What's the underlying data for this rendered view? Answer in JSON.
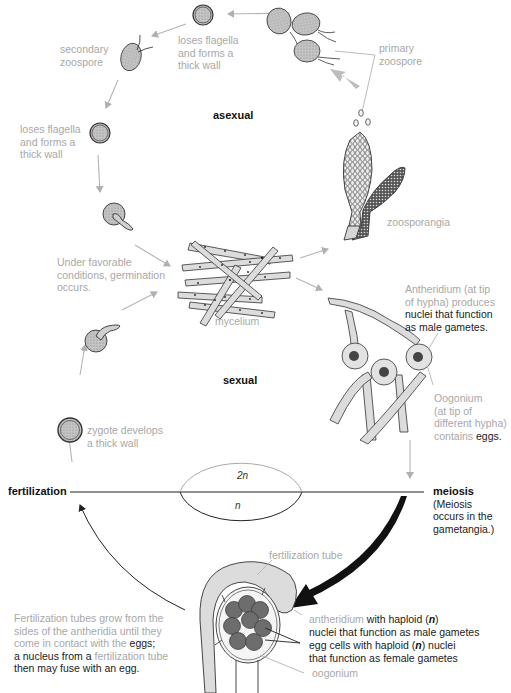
{
  "diagram": {
    "phases": {
      "asexual": "asexual",
      "sexual": "sexual"
    },
    "ploidy": {
      "diploid": "2n",
      "haploid": "n"
    },
    "events": {
      "fertilization": "fertilization",
      "meiosis": "meiosis",
      "meiosis_note": [
        "(Meiosis",
        "occurs in the",
        "gametangia.)"
      ]
    },
    "labels": {
      "loses_flagella_top": [
        "loses flagella",
        "and forms a",
        "thick wall"
      ],
      "secondary_zoospore": [
        "secondary",
        "zoospore"
      ],
      "loses_flagella_left": [
        "loses flagella",
        "and forms a",
        "thick wall"
      ],
      "primary_zoospore": [
        "primary",
        "zoospore"
      ],
      "zoosporangia": "zoosporangia",
      "germination": [
        "Under favorable",
        "conditions, germination",
        "occurs."
      ],
      "mycelium": "mycelium",
      "antheridium_top": {
        "gray": [
          "Antheridium (at tip",
          "of hypha) produces"
        ],
        "dark": [
          "nuclei that function",
          "as male gametes."
        ]
      },
      "oogonium_top": {
        "gray": [
          "Oogonium",
          "(at tip of",
          "different hypha)",
          "contains "
        ],
        "dark": "eggs."
      },
      "zygote": [
        "zygote develops",
        "a thick wall"
      ],
      "fertilization_tubes": {
        "line1": "Fertilization tubes grow from the",
        "line2": "sides of the antheridia until they",
        "line3_gray": "come in contact with the ",
        "line3_dark": "eggs;",
        "line4_dark": "a nucleus from a ",
        "line4_gray": "fertilization tube",
        "line5_dark": "then may fuse with an egg."
      },
      "fertilization_tube": "fertilization tube",
      "antheridium_bottom": {
        "gray": "antheridium",
        "dark1": " with haploid (",
        "n": "n",
        "dark2": ")",
        "line2": "nuclei that function as male gametes"
      },
      "egg_cells": {
        "line1a": "egg cells with haploid (",
        "n": "n",
        "line1b": ") nuclei",
        "line2": "that function as female gametes"
      },
      "oogonium_bottom": "oogonium"
    },
    "colors": {
      "label_gray": "#a8a8a8",
      "dark_text": "#1a1a1a",
      "arrow_gray": "#b4b4b4",
      "cell_fill": "#c9c9c9",
      "hypha_fill": "#dcdcdc",
      "egg_fill": "#6d6d6d"
    }
  }
}
